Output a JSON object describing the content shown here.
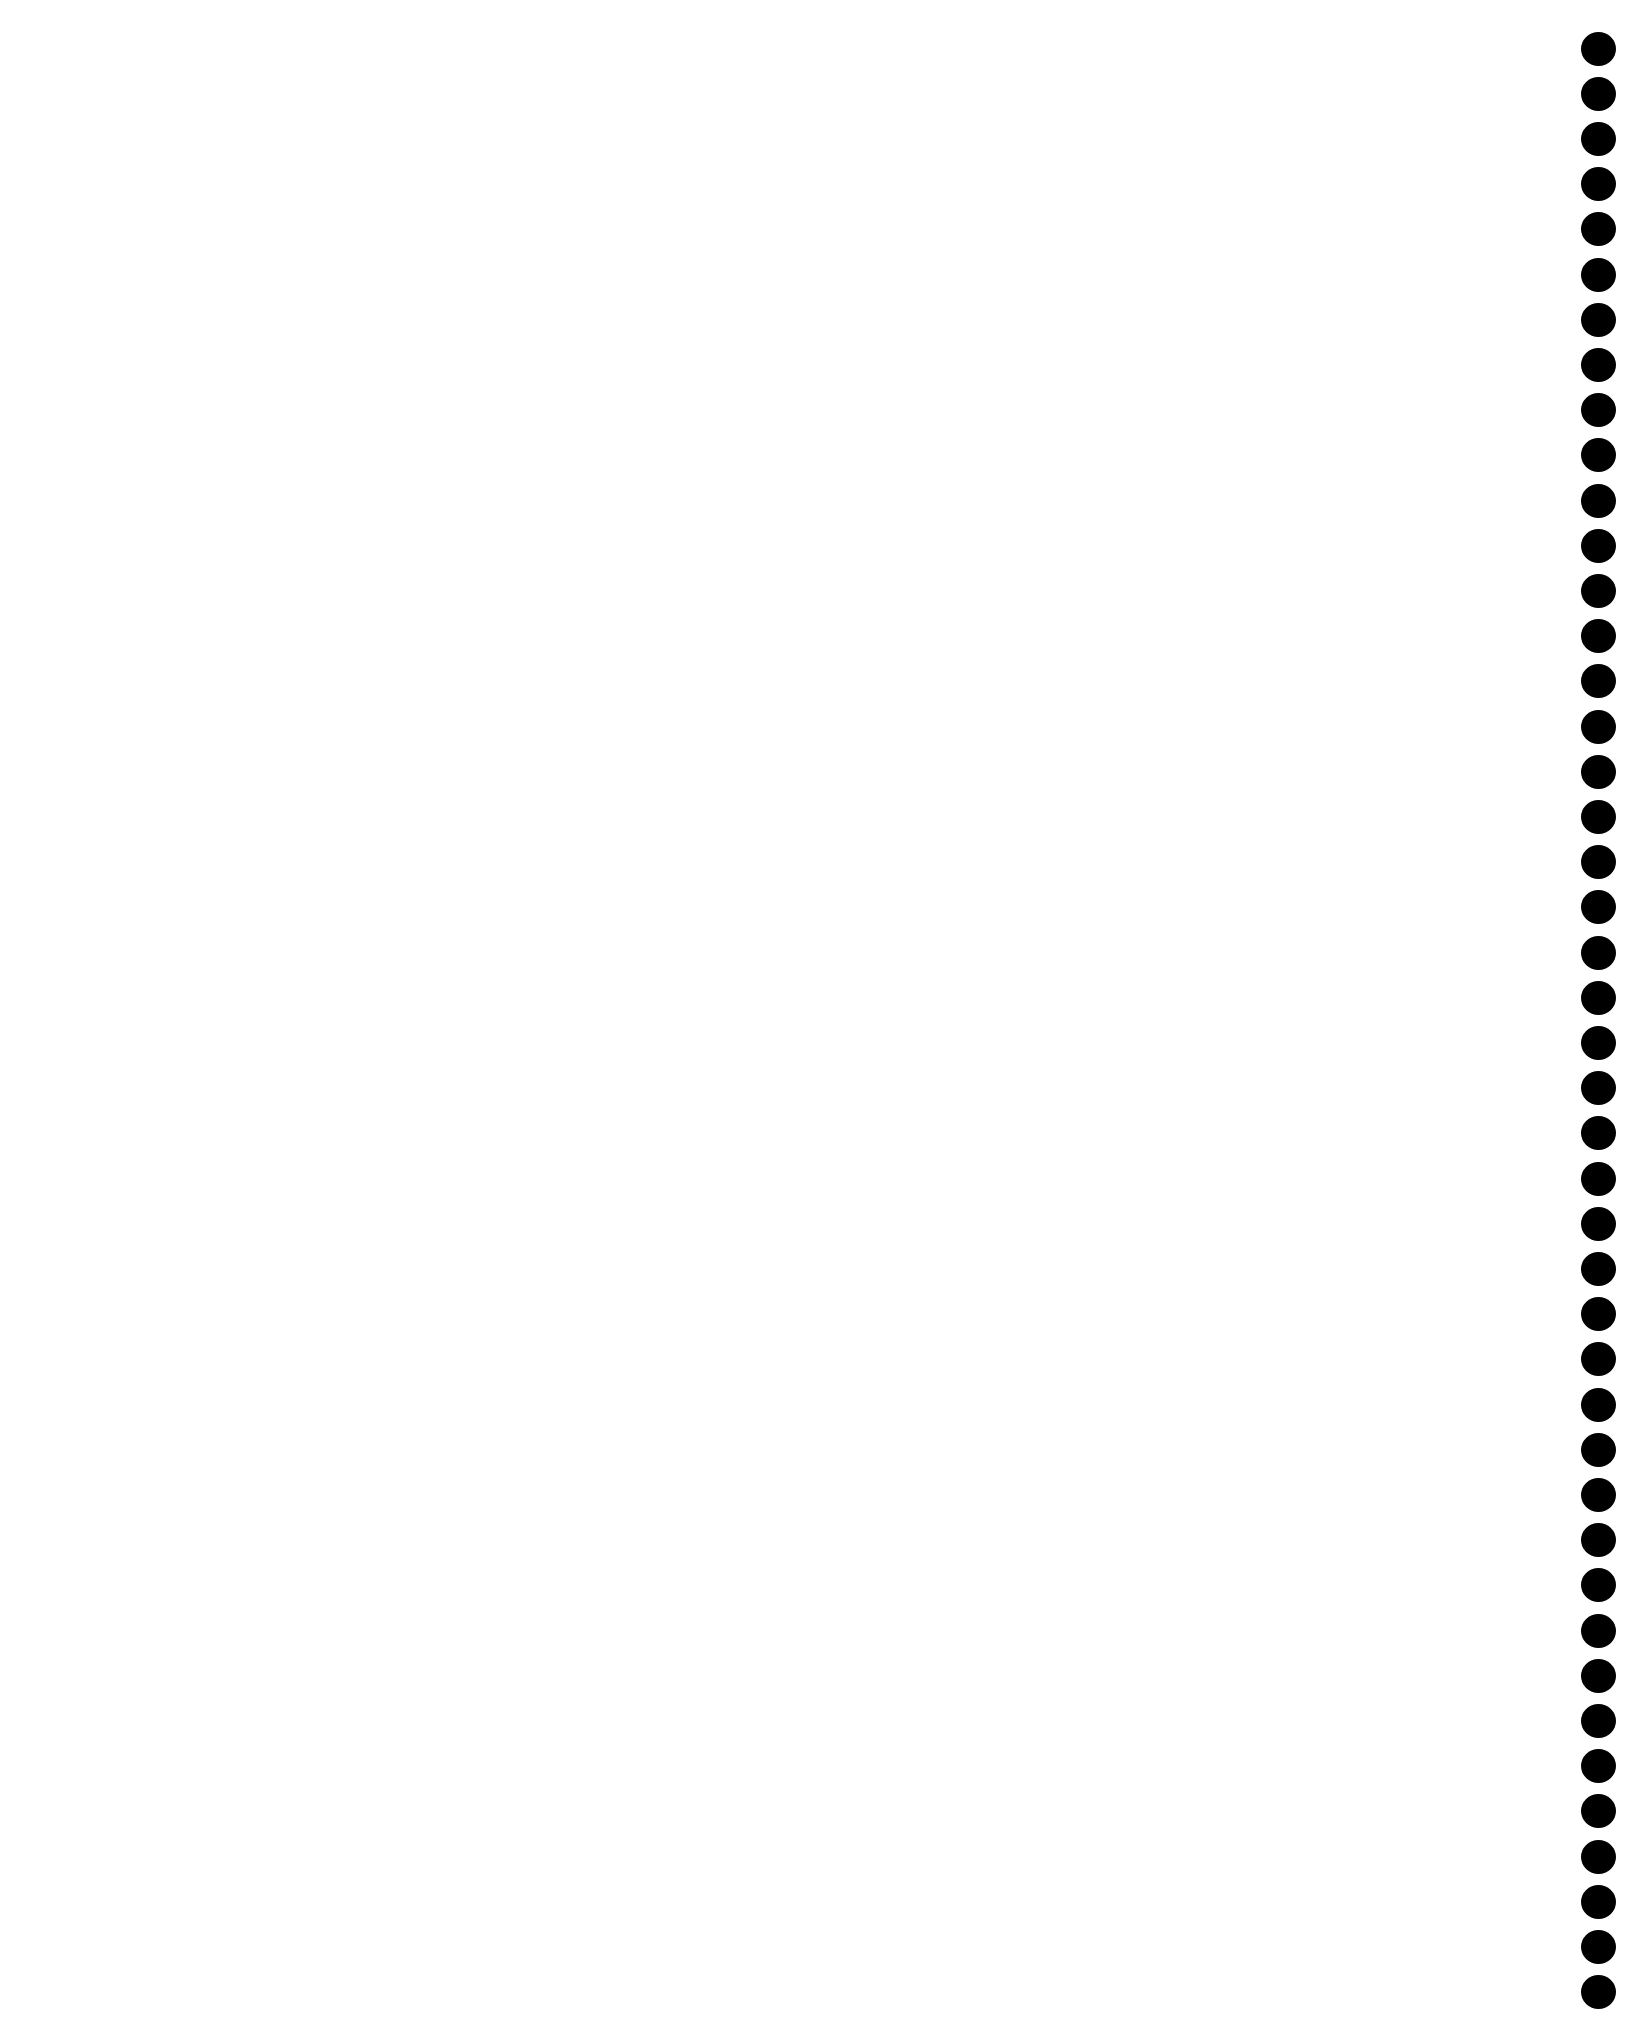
{
  "page": {
    "background": "#ffffff",
    "content": ""
  },
  "binding": {
    "type": "spiral-binding-holes",
    "side": "right",
    "hole_color": "#000000",
    "hole_count": 44,
    "first_center_y": 49,
    "spacing": 45.2,
    "hole_diameter": 35
  }
}
